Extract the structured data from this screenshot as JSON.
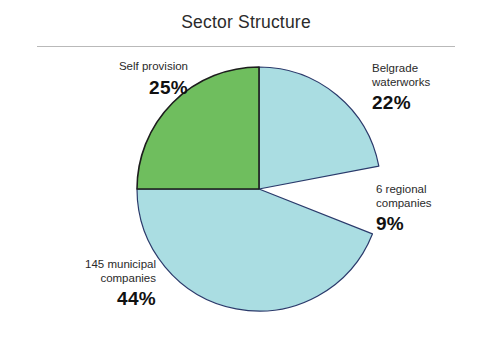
{
  "chart_title": "Sector Structure",
  "chart_data": {
    "type": "pie",
    "title": "Sector Structure",
    "xlabel": "",
    "ylabel": "",
    "legend_position": "callout-labels",
    "grid": false,
    "total_percent": 100,
    "categories": [
      "Self provision",
      "Belgrade waterworks",
      "6 regional companies",
      "145 municipal companies"
    ],
    "values": [
      25,
      22,
      9,
      44
    ],
    "slices": [
      {
        "key": "self-provision",
        "label": "Self provision",
        "label_lines": "Self provision",
        "percent_text": "25%",
        "value": 25,
        "color": "#6fbe5e",
        "exploded": false,
        "start_angle_deg": 270,
        "end_angle_deg": 360
      },
      {
        "key": "belgrade-waterworks",
        "label": "Belgrade waterworks",
        "label_lines": "Belgrade\nwaterworks",
        "percent_text": "22%",
        "value": 22,
        "color": "#aadde2",
        "exploded": false,
        "start_angle_deg": 0,
        "end_angle_deg": 79.2
      },
      {
        "key": "regional-companies",
        "label": "6 regional companies",
        "label_lines": "6 regional\ncompanies",
        "percent_text": "9%",
        "value": 9,
        "color": "#ffffff",
        "exploded": true,
        "start_angle_deg": 79.2,
        "end_angle_deg": 111.6
      },
      {
        "key": "municipal-companies",
        "label": "145 municipal companies",
        "label_lines": "145 municipal\ncompanies",
        "percent_text": "44%",
        "value": 44,
        "color": "#aadde2",
        "exploded": false,
        "start_angle_deg": 111.6,
        "end_angle_deg": 270
      }
    ],
    "colors": {
      "green": "#6fbe5e",
      "light_blue": "#aadde2",
      "outline": "#2a3a6b",
      "background": "#ffffff",
      "title_rule": "#b9b9b9"
    }
  }
}
